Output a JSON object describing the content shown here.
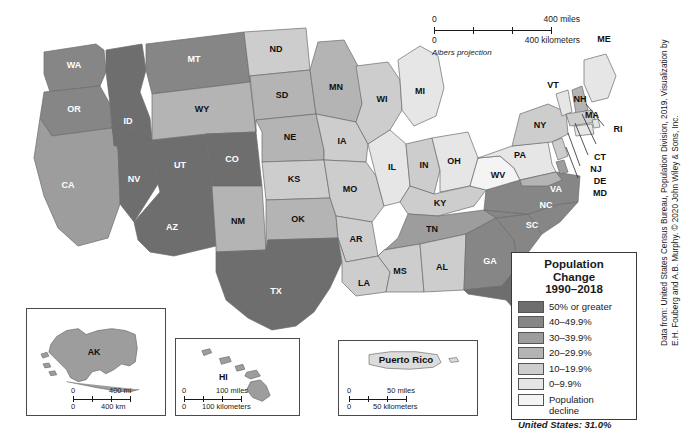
{
  "map": {
    "title": "United States Population Change 1990-2018",
    "projection_note": "Albers projection",
    "scale": {
      "miles_zero": "0",
      "miles_label": "400 miles",
      "km_zero": "0",
      "km_label": "400 kilometers"
    }
  },
  "legend": {
    "title_line1": "Population",
    "title_line2": "Change",
    "title_line3": "1990–2018",
    "classes": [
      {
        "label": "50% or greater",
        "color": "#6e6e6e"
      },
      {
        "label": "40–49.9%",
        "color": "#868686"
      },
      {
        "label": "30–39.9%",
        "color": "#9d9d9d"
      },
      {
        "label": "20–29.9%",
        "color": "#b4b4b4"
      },
      {
        "label": "10–19.9%",
        "color": "#cdcdcd"
      },
      {
        "label": "0–9.9%",
        "color": "#e6e6e6"
      },
      {
        "label": "Population decline",
        "color": "#f4f4f4"
      }
    ],
    "summary": "United States: 31.0%"
  },
  "insets": {
    "alaska": {
      "label": "AK",
      "scale": {
        "miles_zero": "0",
        "miles_label": "400 mi",
        "km_zero": "0",
        "km_label": "400 km"
      }
    },
    "hawaii": {
      "label": "HI",
      "scale": {
        "miles_zero": "0",
        "miles_label": "100 miles",
        "km_zero": "0",
        "km_label": "100 kilometers"
      }
    },
    "puerto_rico": {
      "label": "Puerto Rico",
      "scale": {
        "miles_zero": "0",
        "miles_label": "50 miles",
        "km_zero": "0",
        "km_label": "50 kilometers"
      }
    }
  },
  "credit": {
    "line1": "Data from: United States Census Bureau, Population Division, 2019. Visualization by",
    "line2": "E.H. Fouberg and A.B. Murphy. © 2020 John Wiley & Sons, Inc."
  },
  "chart_data": {
    "type": "map",
    "title": "Population Change 1990–2018",
    "units": "percent change",
    "national_value": "31.0%",
    "classes": [
      "50% or greater",
      "40–49.9%",
      "30–39.9%",
      "20–29.9%",
      "10–19.9%",
      "0–9.9%",
      "Population decline"
    ],
    "states": [
      {
        "code": "WA",
        "class": "40–49.9%"
      },
      {
        "code": "OR",
        "class": "40–49.9%"
      },
      {
        "code": "CA",
        "class": "30–39.9%"
      },
      {
        "code": "ID",
        "class": "50% or greater"
      },
      {
        "code": "NV",
        "class": "50% or greater"
      },
      {
        "code": "UT",
        "class": "50% or greater"
      },
      {
        "code": "AZ",
        "class": "50% or greater"
      },
      {
        "code": "MT",
        "class": "40–49.9%"
      },
      {
        "code": "WY",
        "class": "20–29.9%"
      },
      {
        "code": "CO",
        "class": "50% or greater"
      },
      {
        "code": "NM",
        "class": "20–29.9%"
      },
      {
        "code": "ND",
        "class": "10–19.9%"
      },
      {
        "code": "SD",
        "class": "20–29.9%"
      },
      {
        "code": "NE",
        "class": "20–29.9%"
      },
      {
        "code": "KS",
        "class": "10–19.9%"
      },
      {
        "code": "OK",
        "class": "20–29.9%"
      },
      {
        "code": "TX",
        "class": "50% or greater"
      },
      {
        "code": "MN",
        "class": "20–29.9%"
      },
      {
        "code": "IA",
        "class": "10–19.9%"
      },
      {
        "code": "MO",
        "class": "10–19.9%"
      },
      {
        "code": "AR",
        "class": "10–19.9%"
      },
      {
        "code": "LA",
        "class": "10–19.9%"
      },
      {
        "code": "WI",
        "class": "10–19.9%"
      },
      {
        "code": "IL",
        "class": "0–9.9%"
      },
      {
        "code": "MI",
        "class": "0–9.9%"
      },
      {
        "code": "IN",
        "class": "10–19.9%"
      },
      {
        "code": "OH",
        "class": "0–9.9%"
      },
      {
        "code": "KY",
        "class": "10–19.9%"
      },
      {
        "code": "TN",
        "class": "30–39.9%"
      },
      {
        "code": "MS",
        "class": "10–19.9%"
      },
      {
        "code": "AL",
        "class": "10–19.9%"
      },
      {
        "code": "GA",
        "class": "40–49.9%"
      },
      {
        "code": "FL",
        "class": "50% or greater"
      },
      {
        "code": "SC",
        "class": "40–49.9%"
      },
      {
        "code": "NC",
        "class": "40–49.9%"
      },
      {
        "code": "VA",
        "class": "40–49.9%"
      },
      {
        "code": "WV",
        "class": "Population decline"
      },
      {
        "code": "PA",
        "class": "0–9.9%"
      },
      {
        "code": "NY",
        "class": "10–19.9%"
      },
      {
        "code": "VT",
        "class": "0–9.9%"
      },
      {
        "code": "NH",
        "class": "20–29.9%"
      },
      {
        "code": "ME",
        "class": "0–9.9%"
      },
      {
        "code": "MA",
        "class": "10–19.9%"
      },
      {
        "code": "RI",
        "class": "0–9.9%"
      },
      {
        "code": "CT",
        "class": "0–9.9%"
      },
      {
        "code": "NJ",
        "class": "10–19.9%"
      },
      {
        "code": "DE",
        "class": "30–39.9%"
      },
      {
        "code": "MD",
        "class": "20–29.9%"
      },
      {
        "code": "AK",
        "class": "30–39.9%"
      },
      {
        "code": "HI",
        "class": "30–39.9%"
      },
      {
        "code": "PR",
        "class": "Population decline"
      }
    ]
  }
}
